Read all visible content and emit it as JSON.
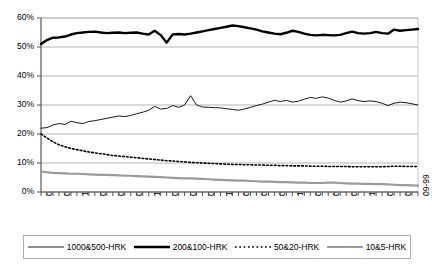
{
  "chart_data": {
    "type": "line",
    "title": "",
    "xlabel": "",
    "ylabel": "",
    "ylim": [
      0,
      60
    ],
    "yticks": [
      0,
      10,
      20,
      30,
      40,
      50,
      60
    ],
    "ytick_labels": [
      "0%",
      "10%",
      "20%",
      "30%",
      "40%",
      "50%",
      "60%"
    ],
    "grid": true,
    "legend_position": "bottom",
    "x_tick_interval_months": 1,
    "x_label_interval_months": 3,
    "categories": [
      "06-94",
      "07-94",
      "08-94",
      "09-94",
      "10-94",
      "11-94",
      "12-94",
      "01-95",
      "02-95",
      "03-95",
      "04-95",
      "05-95",
      "06-95",
      "07-95",
      "08-95",
      "09-95",
      "10-95",
      "11-95",
      "12-95",
      "01-96",
      "02-96",
      "03-96",
      "04-96",
      "05-96",
      "06-96",
      "07-96",
      "08-96",
      "09-96",
      "10-96",
      "11-96",
      "12-96",
      "01-97",
      "02-97",
      "03-97",
      "04-97",
      "05-97",
      "06-97",
      "07-97",
      "08-97",
      "09-97",
      "10-97",
      "11-97",
      "12-97",
      "01-98",
      "02-98",
      "03-98",
      "04-98",
      "05-98",
      "06-98",
      "07-98",
      "08-98",
      "09-98",
      "10-98",
      "11-98",
      "12-98",
      "01-99",
      "02-99",
      "03-99",
      "04-99",
      "05-99",
      "06-99",
      "07-99",
      "08-99",
      "09-99"
    ],
    "x_labels_shown": [
      "06-94",
      "09-94",
      "12-94",
      "03-95",
      "06-95",
      "09-95",
      "12-95",
      "03-96",
      "06-96",
      "09-96",
      "12-96",
      "03-97",
      "06-97",
      "09-97",
      "12-97",
      "03-98",
      "06-98",
      "09-98",
      "12-98",
      "03-99",
      "06-99",
      "09-99"
    ],
    "series": [
      {
        "name": "1000&500-HRK",
        "style": "solid-thin",
        "color": "#1a1a1a",
        "width": 1,
        "values": [
          22.0,
          22.2,
          23.1,
          23.6,
          23.3,
          24.4,
          23.9,
          23.6,
          24.3,
          24.6,
          25.0,
          25.4,
          25.8,
          26.2,
          26.0,
          26.4,
          27.0,
          27.5,
          28.2,
          29.5,
          28.6,
          28.8,
          29.8,
          29.2,
          30.0,
          33.2,
          30.0,
          29.3,
          29.2,
          29.1,
          29.0,
          28.7,
          28.5,
          28.2,
          28.6,
          29.2,
          29.8,
          30.3,
          31.0,
          31.6,
          31.2,
          31.6,
          31.0,
          31.3,
          32.0,
          32.6,
          32.3,
          32.8,
          32.4,
          31.6,
          31.0,
          31.4,
          32.1,
          31.5,
          31.2,
          31.4,
          31.2,
          30.6,
          29.8,
          30.6,
          31.0,
          30.8,
          30.4,
          30.0
        ]
      },
      {
        "name": "200&100-HRK",
        "style": "solid-thick",
        "color": "#000000",
        "width": 2.4,
        "values": [
          51.0,
          52.4,
          53.2,
          53.3,
          53.6,
          54.3,
          54.8,
          55.0,
          55.2,
          55.3,
          55.0,
          54.8,
          54.9,
          55.0,
          54.8,
          54.9,
          55.0,
          54.6,
          54.3,
          55.6,
          54.1,
          51.5,
          54.3,
          54.5,
          54.3,
          54.6,
          55.0,
          55.4,
          55.8,
          56.2,
          56.6,
          57.0,
          57.4,
          57.2,
          56.8,
          56.4,
          56.0,
          55.4,
          55.0,
          54.6,
          54.4,
          54.9,
          55.6,
          55.2,
          54.6,
          54.2,
          54.0,
          54.2,
          54.1,
          54.0,
          54.2,
          54.8,
          55.3,
          54.8,
          54.6,
          54.8,
          55.2,
          54.8,
          54.6,
          56.0,
          55.6,
          55.8,
          56.0,
          56.2
        ]
      },
      {
        "name": "50&20-HRK",
        "style": "dotted",
        "color": "#000000",
        "width": 1.6,
        "values": [
          20.0,
          18.6,
          17.3,
          16.3,
          15.6,
          15.0,
          14.6,
          14.2,
          13.8,
          13.5,
          13.2,
          12.9,
          12.6,
          12.4,
          12.2,
          12.0,
          11.8,
          11.6,
          11.4,
          11.2,
          11.0,
          10.8,
          10.7,
          10.5,
          10.4,
          10.2,
          10.1,
          10.0,
          9.9,
          9.8,
          9.7,
          9.6,
          9.5,
          9.5,
          9.4,
          9.4,
          9.3,
          9.3,
          9.2,
          9.2,
          9.1,
          9.1,
          9.0,
          9.0,
          9.0,
          8.9,
          8.9,
          8.9,
          8.8,
          8.8,
          8.8,
          8.8,
          8.7,
          8.7,
          8.7,
          8.7,
          8.7,
          8.7,
          8.8,
          8.9,
          8.9,
          8.8,
          8.8,
          8.8
        ]
      },
      {
        "name": "10&5-HRK",
        "style": "solid-thick-gray",
        "color": "#9a9a9a",
        "width": 2.2,
        "values": [
          7.0,
          6.8,
          6.6,
          6.5,
          6.4,
          6.3,
          6.3,
          6.2,
          6.1,
          6.0,
          5.9,
          5.9,
          5.8,
          5.7,
          5.6,
          5.6,
          5.5,
          5.4,
          5.3,
          5.2,
          5.1,
          5.0,
          4.9,
          4.8,
          4.7,
          4.7,
          4.6,
          4.5,
          4.4,
          4.3,
          4.2,
          4.1,
          4.0,
          3.9,
          3.9,
          3.8,
          3.7,
          3.6,
          3.6,
          3.5,
          3.4,
          3.4,
          3.3,
          3.2,
          3.2,
          3.1,
          3.1,
          3.1,
          3.2,
          3.2,
          3.1,
          3.0,
          2.9,
          2.9,
          2.8,
          2.8,
          2.7,
          2.7,
          2.6,
          2.5,
          2.4,
          2.4,
          2.3,
          2.2
        ]
      }
    ]
  },
  "legend": {
    "items": [
      {
        "label": "1000&500-HRK"
      },
      {
        "label": "200&100-HRK"
      },
      {
        "label": "50&20-HRK"
      },
      {
        "label": "10&5-HRK"
      }
    ]
  }
}
